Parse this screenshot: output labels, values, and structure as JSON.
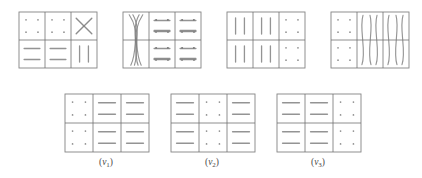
{
  "figure": {
    "type": "glyph-matrix-diagram",
    "background_color": "#ffffff",
    "grid_line_color": "#6e6e6e",
    "glyph_color": "#7a7a7a",
    "caption_color": "#4a4a4a",
    "rows": 2,
    "cols": 3,
    "top_row": [
      {
        "id": "matrix-1",
        "x": 18,
        "y": 11,
        "w": 78,
        "h": 56,
        "cells": [
          {
            "r": 0,
            "c": 0,
            "glyph": "dots",
            "count": 4
          },
          {
            "r": 0,
            "c": 1,
            "glyph": "dots",
            "count": 4
          },
          {
            "r": 0,
            "c": 2,
            "glyph": "cross-x",
            "count": 1
          },
          {
            "r": 1,
            "c": 0,
            "glyph": "horizontal-lines",
            "count": 2
          },
          {
            "r": 1,
            "c": 1,
            "glyph": "horizontal-lines",
            "count": 2
          },
          {
            "r": 1,
            "c": 2,
            "glyph": "vertical-bars",
            "count": 2
          }
        ],
        "spans": []
      },
      {
        "id": "matrix-2",
        "x": 122,
        "y": 11,
        "w": 78,
        "h": 56,
        "cells": [
          {
            "r": 0,
            "c": 1,
            "glyph": "dots",
            "count": 4
          },
          {
            "r": 0,
            "c": 2,
            "glyph": "dots",
            "count": 4
          },
          {
            "r": 0,
            "c": 1,
            "glyph": "horizontal-lines",
            "count": 1
          },
          {
            "r": 0,
            "c": 2,
            "glyph": "horizontal-lines",
            "count": 1
          },
          {
            "r": 1,
            "c": 1,
            "glyph": "dots",
            "count": 4
          },
          {
            "r": 1,
            "c": 2,
            "glyph": "dots",
            "count": 4
          },
          {
            "r": 1,
            "c": 1,
            "glyph": "horizontal-lines",
            "count": 1
          },
          {
            "r": 1,
            "c": 2,
            "glyph": "horizontal-lines",
            "count": 1
          }
        ],
        "spans": [
          {
            "col": 0,
            "glyph": "crossing-squiggles",
            "count": 4
          }
        ]
      },
      {
        "id": "matrix-3",
        "x": 226,
        "y": 11,
        "w": 78,
        "h": 56,
        "cells": [
          {
            "r": 0,
            "c": 0,
            "glyph": "vertical-bars",
            "count": 2
          },
          {
            "r": 0,
            "c": 1,
            "glyph": "vertical-bars",
            "count": 2
          },
          {
            "r": 0,
            "c": 2,
            "glyph": "dots",
            "count": 4
          },
          {
            "r": 1,
            "c": 0,
            "glyph": "vertical-bars",
            "count": 2
          },
          {
            "r": 1,
            "c": 1,
            "glyph": "vertical-bars",
            "count": 2
          },
          {
            "r": 1,
            "c": 2,
            "glyph": "dots",
            "count": 4
          }
        ],
        "spans": []
      },
      {
        "id": "matrix-4",
        "x": 330,
        "y": 11,
        "w": 78,
        "h": 56,
        "cells": [
          {
            "r": 0,
            "c": 0,
            "glyph": "dots",
            "count": 4
          },
          {
            "r": 1,
            "c": 0,
            "glyph": "dots",
            "count": 4
          }
        ],
        "spans": [
          {
            "col": 1,
            "glyph": "wavy-curves",
            "count": 3
          },
          {
            "col": 2,
            "glyph": "wavy-curves",
            "count": 3
          }
        ]
      }
    ],
    "bottom_row": [
      {
        "id": "matrix-nu1",
        "x": 64,
        "y": 93,
        "w": 84,
        "h": 58,
        "label": "(ν₁)",
        "label_base": "ν",
        "label_sub": "1",
        "cells": [
          {
            "r": 0,
            "c": 0,
            "glyph": "dots",
            "count": 4
          },
          {
            "r": 0,
            "c": 1,
            "glyph": "horizontal-lines",
            "count": 2
          },
          {
            "r": 0,
            "c": 2,
            "glyph": "horizontal-lines",
            "count": 2
          },
          {
            "r": 1,
            "c": 0,
            "glyph": "dots",
            "count": 4
          },
          {
            "r": 1,
            "c": 1,
            "glyph": "horizontal-lines",
            "count": 2
          },
          {
            "r": 1,
            "c": 2,
            "glyph": "horizontal-lines",
            "count": 2
          }
        ]
      },
      {
        "id": "matrix-nu2",
        "x": 170,
        "y": 93,
        "w": 84,
        "h": 58,
        "label": "(ν₂)",
        "label_base": "ν",
        "label_sub": "2",
        "cells": [
          {
            "r": 0,
            "c": 0,
            "glyph": "horizontal-lines",
            "count": 2
          },
          {
            "r": 0,
            "c": 1,
            "glyph": "dots",
            "count": 4
          },
          {
            "r": 0,
            "c": 2,
            "glyph": "horizontal-lines",
            "count": 2
          },
          {
            "r": 1,
            "c": 0,
            "glyph": "horizontal-lines",
            "count": 2
          },
          {
            "r": 1,
            "c": 1,
            "glyph": "dots",
            "count": 4
          },
          {
            "r": 1,
            "c": 2,
            "glyph": "horizontal-lines",
            "count": 2
          }
        ]
      },
      {
        "id": "matrix-nu3",
        "x": 276,
        "y": 93,
        "w": 84,
        "h": 58,
        "label": "(ν₃)",
        "label_base": "ν",
        "label_sub": "3",
        "cells": [
          {
            "r": 0,
            "c": 0,
            "glyph": "horizontal-lines",
            "count": 2
          },
          {
            "r": 0,
            "c": 1,
            "glyph": "horizontal-lines",
            "count": 2
          },
          {
            "r": 0,
            "c": 2,
            "glyph": "dots",
            "count": 4
          },
          {
            "r": 1,
            "c": 0,
            "glyph": "horizontal-lines",
            "count": 2
          },
          {
            "r": 1,
            "c": 1,
            "glyph": "horizontal-lines",
            "count": 2
          },
          {
            "r": 1,
            "c": 2,
            "glyph": "dots",
            "count": 4
          }
        ]
      }
    ]
  }
}
